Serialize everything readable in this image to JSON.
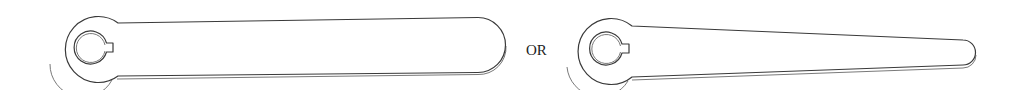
{
  "diagram": {
    "type": "technical-line-drawing",
    "separator_label": "OR",
    "parts": [
      {
        "name": "Straight arm with keyed hub",
        "shape": "straight-arm"
      },
      {
        "name": "Tapered arm with keyed hub",
        "shape": "tapered-arm"
      }
    ],
    "colors": {
      "stroke": "#3a3a3a",
      "background": "#ffffff"
    }
  }
}
